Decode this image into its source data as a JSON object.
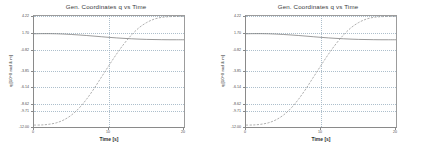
{
  "figure": {
    "background_color": "#ffffff",
    "panel_count": 2
  },
  "panels": [
    {
      "id": "panel-left",
      "title": "Gen. Coordinates q vs Time",
      "xlabel": "Time [s]",
      "ylabel": "q [10^0 rad & m]"
    },
    {
      "id": "panel-right",
      "title": "Gen. Coordinates q vs Time",
      "xlabel": "Time [s]",
      "ylabel": "q [10^0 rad & m]"
    }
  ],
  "chart_data": [
    {
      "type": "line",
      "title": "Gen. Coordinates q vs Time",
      "xlabel": "Time [s]",
      "ylabel": "q [10^0 rad & m]",
      "xlim": [
        0,
        20
      ],
      "ylim": [
        -12.0,
        4.22
      ],
      "xticks": [
        0,
        10,
        20
      ],
      "xticklabels": [
        "0",
        "10",
        "20"
      ],
      "yticks": [
        4.22,
        1.7,
        -0.82,
        -3.85,
        -6.14,
        -8.62,
        -9.71,
        -12.0
      ],
      "yticklabels": [
        "4.22",
        "1.70",
        "-0.82",
        "-3.85",
        "-6.14",
        "-8.62",
        "-9.71",
        "-12.00"
      ],
      "grid": true,
      "grid_color": "#9fb4c4",
      "grid_style": "dotted",
      "legend": false,
      "series": [
        {
          "name": "q1",
          "style": "solid",
          "color": "#6f6f6f",
          "x": [
            0,
            1,
            2,
            3,
            4,
            5,
            6,
            7,
            8,
            9,
            10,
            11,
            12,
            13,
            14,
            15,
            16,
            17,
            18,
            19,
            20
          ],
          "values": [
            1.62,
            1.64,
            1.64,
            1.62,
            1.58,
            1.52,
            1.45,
            1.37,
            1.28,
            1.19,
            1.1,
            1.02,
            0.95,
            0.89,
            0.84,
            0.8,
            0.78,
            0.76,
            0.75,
            0.75,
            0.75
          ]
        },
        {
          "name": "q2",
          "style": "dashed",
          "color": "#8c8c8c",
          "x": [
            0,
            1,
            2,
            3,
            4,
            5,
            6,
            7,
            8,
            9,
            10,
            11,
            12,
            13,
            14,
            15,
            16,
            17,
            18,
            19,
            20
          ],
          "values": [
            -11.72,
            -11.7,
            -11.6,
            -11.38,
            -10.95,
            -10.25,
            -9.25,
            -7.95,
            -6.4,
            -4.7,
            -3.0,
            -1.35,
            0.15,
            1.45,
            2.5,
            3.25,
            3.75,
            4.02,
            4.12,
            4.15,
            4.15
          ]
        }
      ]
    },
    {
      "type": "line",
      "title": "Gen. Coordinates q vs Time",
      "xlabel": "Time [s]",
      "ylabel": "q [10^0 rad & m]",
      "xlim": [
        0,
        20
      ],
      "ylim": [
        -12.0,
        4.22
      ],
      "xticks": [
        0,
        10,
        20
      ],
      "xticklabels": [
        "0",
        "10",
        "20"
      ],
      "yticks": [
        4.22,
        1.7,
        -0.82,
        -3.85,
        -6.14,
        -8.62,
        -9.71,
        -12.0
      ],
      "yticklabels": [
        "4.22",
        "1.70",
        "-0.82",
        "-3.85",
        "-6.14",
        "-8.62",
        "-9.71",
        "-12.00"
      ],
      "grid": true,
      "grid_color": "#9fb4c4",
      "grid_style": "dotted",
      "legend": false,
      "series": [
        {
          "name": "q1",
          "style": "solid",
          "color": "#6f6f6f",
          "x": [
            0,
            1,
            2,
            3,
            4,
            5,
            6,
            7,
            8,
            9,
            10,
            11,
            12,
            13,
            14,
            15,
            16,
            17,
            18,
            19,
            20
          ],
          "values": [
            1.62,
            1.64,
            1.64,
            1.62,
            1.58,
            1.52,
            1.45,
            1.37,
            1.28,
            1.19,
            1.1,
            1.02,
            0.95,
            0.89,
            0.84,
            0.8,
            0.78,
            0.76,
            0.75,
            0.75,
            0.75
          ]
        },
        {
          "name": "q2",
          "style": "dashed",
          "color": "#8c8c8c",
          "x": [
            0,
            1,
            2,
            3,
            4,
            5,
            6,
            7,
            8,
            9,
            10,
            11,
            12,
            13,
            14,
            15,
            16,
            17,
            18,
            19,
            20
          ],
          "values": [
            -11.72,
            -11.7,
            -11.6,
            -11.38,
            -10.95,
            -10.25,
            -9.25,
            -7.95,
            -6.4,
            -4.7,
            -3.0,
            -1.35,
            0.15,
            1.45,
            2.5,
            3.25,
            3.75,
            4.02,
            4.12,
            4.15,
            4.15
          ]
        }
      ]
    }
  ]
}
